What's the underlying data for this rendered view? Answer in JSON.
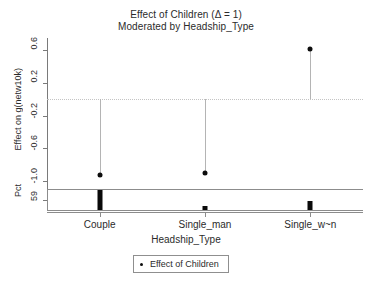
{
  "chart_data": {
    "type": "scatter",
    "title": "Effect of Children (Δ = 1)",
    "subtitle": "Moderated by Headship_Type",
    "xlabel": "Headship_Type",
    "ylabel": "Effect on g(netw10k)",
    "ylabel_secondary": "Pct",
    "categories": [
      "Couple",
      "Single_man",
      "Single_w~n"
    ],
    "values": [
      -0.93,
      -0.9,
      0.62
    ],
    "ylim": [
      -1.15,
      0.75
    ],
    "yticks": [
      0.6,
      0.2,
      -0.2,
      -0.6,
      -1.0
    ],
    "yticklabels": [
      "0.6",
      "0.2",
      "-0.2",
      "-0.6",
      "-1.0"
    ],
    "pct_ticks": [
      59
    ],
    "pct_ticklabels": [
      "59"
    ],
    "pct_values": [
      59,
      13,
      28
    ],
    "reference_line": 0,
    "grid": false,
    "legend": {
      "position": "bottom",
      "entries": [
        {
          "label": "Effect of Children",
          "marker": "point-marker",
          "color": "#0d0d0d"
        }
      ]
    },
    "series": [
      {
        "name": "Effect of Children",
        "type": "stem",
        "color": "#0d0d0d",
        "stem_color": "#b4b4b4",
        "points": [
          {
            "category": "Couple",
            "value": -0.93
          },
          {
            "category": "Single_man",
            "value": -0.9
          },
          {
            "category": "Single_w~n",
            "value": 0.62
          }
        ]
      }
    ]
  },
  "colors": {
    "background": "#ffffff",
    "axis": "#8c8c8c",
    "text": "#2b2b2b",
    "marker": "#0d0d0d",
    "stem": "#b4b4b4",
    "gridline": "#c4c4c4"
  }
}
